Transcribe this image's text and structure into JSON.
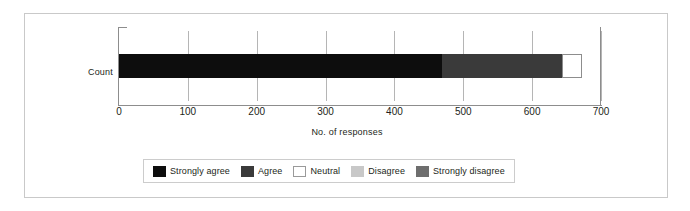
{
  "chart_data": {
    "type": "bar",
    "orientation": "horizontal",
    "stacked": true,
    "title": "",
    "xlabel": "No. of responses",
    "ylabel": "",
    "categories": [
      "Count"
    ],
    "xlim": [
      0,
      700
    ],
    "xticks": [
      0,
      100,
      200,
      300,
      400,
      500,
      600,
      700
    ],
    "xtick_labels": [
      "0",
      "100",
      "200",
      "300",
      "400",
      "500",
      "600",
      "700"
    ],
    "grid": true,
    "legend_position": "bottom",
    "series": [
      {
        "name": "Strongly agree",
        "values": [
          469
        ],
        "color": "#0d0d0d"
      },
      {
        "name": "Agree",
        "values": [
          174
        ],
        "color": "#3a3a3a"
      },
      {
        "name": "Neutral",
        "values": [
          29
        ],
        "color": "#ffffff"
      },
      {
        "name": "Disagree",
        "values": [
          0
        ],
        "color": "#c8c8c8"
      },
      {
        "name": "Strongly disagree",
        "values": [
          0
        ],
        "color": "#6e6e6e"
      }
    ]
  },
  "legend": {
    "items": [
      {
        "label": "Strongly agree",
        "color": "#0d0d0d"
      },
      {
        "label": "Agree",
        "color": "#3a3a3a"
      },
      {
        "label": "Neutral",
        "color": "#ffffff"
      },
      {
        "label": "Disagree",
        "color": "#c8c8c8"
      },
      {
        "label": "Strongly disagree",
        "color": "#6e6e6e"
      }
    ]
  },
  "axes": {
    "category_label": "Count",
    "x_title": "No. of responses"
  }
}
